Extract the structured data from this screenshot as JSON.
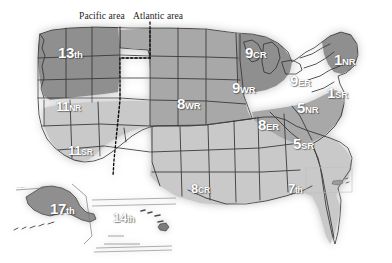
{
  "map": {
    "title": "United States district regions map",
    "area_divider": {
      "pacific_label": "Pacific area",
      "atlantic_label": "Atlantic area",
      "style": "dotted"
    },
    "colors": {
      "dark_region": "#8f8f8f",
      "mid_region": "#a8a8a8",
      "light_region": "#c9c9c9",
      "border": "#3a3a3a",
      "label_text": "#ffffff",
      "caption_text": "#1c1c1c",
      "background": "#ffffff",
      "glow": "#d7d7d7"
    },
    "regions": [
      {
        "id": "13th",
        "number": "13",
        "suffix": "th",
        "x": 58,
        "y": 45,
        "shade": "dark"
      },
      {
        "id": "11NR",
        "number": "11",
        "suffix": "NR",
        "x": 56,
        "y": 98,
        "shade": "light"
      },
      {
        "id": "11SR",
        "number": "11",
        "suffix": "SR",
        "x": 68,
        "y": 142,
        "shade": "light"
      },
      {
        "id": "8WR",
        "number": "8",
        "suffix": "WR",
        "x": 177,
        "y": 96,
        "shade": "mid"
      },
      {
        "id": "9WR",
        "number": "9",
        "suffix": "WR",
        "x": 232,
        "y": 80,
        "shade": "dark"
      },
      {
        "id": "9CR",
        "number": "9",
        "suffix": "CR",
        "x": 245,
        "y": 45,
        "shade": "dark"
      },
      {
        "id": "9ER",
        "number": "9",
        "suffix": "ER",
        "x": 290,
        "y": 73,
        "shade": "mid"
      },
      {
        "id": "1NR",
        "number": "1",
        "suffix": "NR",
        "x": 334,
        "y": 52,
        "shade": "dark"
      },
      {
        "id": "1SR",
        "number": "1",
        "suffix": "SR",
        "x": 327,
        "y": 85,
        "shade": "mid"
      },
      {
        "id": "5NR",
        "number": "5",
        "suffix": "NR",
        "x": 297,
        "y": 100,
        "shade": "mid"
      },
      {
        "id": "8ER",
        "number": "8",
        "suffix": "ER",
        "x": 258,
        "y": 117,
        "shade": "mid"
      },
      {
        "id": "5SR",
        "number": "5",
        "suffix": "SR",
        "x": 293,
        "y": 136,
        "shade": "mid"
      },
      {
        "id": "8CR",
        "number": "8",
        "suffix": "CR",
        "x": 191,
        "y": 180,
        "shade": "light"
      },
      {
        "id": "7th",
        "number": "7",
        "suffix": "th",
        "x": 288,
        "y": 180,
        "shade": "light"
      },
      {
        "id": "17th",
        "number": "17",
        "suffix": "th",
        "x": 50,
        "y": 201,
        "shade": "dark"
      },
      {
        "id": "14th",
        "number": "14",
        "suffix": "th",
        "x": 113,
        "y": 209,
        "shade": "light"
      }
    ],
    "insets": [
      {
        "id": "alaska",
        "label": "ALASKA"
      },
      {
        "id": "hawaii",
        "label": "HAWAII"
      },
      {
        "id": "caribbean",
        "label": ""
      }
    ]
  }
}
